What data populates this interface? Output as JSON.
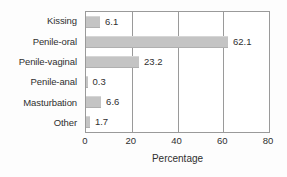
{
  "chart_data": {
    "type": "bar",
    "orientation": "horizontal",
    "title": "",
    "subtitle": "",
    "categories": [
      "Kissing",
      "Penile-oral",
      "Penile-vaginal",
      "Penile-anal",
      "Masturbation",
      "Other"
    ],
    "values": [
      6.1,
      62.1,
      23.2,
      0.3,
      6.6,
      1.7
    ],
    "data_labels": [
      "6.1",
      "62.1",
      "23.2",
      "0.3",
      "6.6",
      "1.7"
    ],
    "xlabel": "Percentage",
    "ylabel": "",
    "xlim": [
      0,
      80
    ],
    "xticks": [
      0,
      20,
      40,
      60,
      80
    ],
    "xtick_labels": [
      "0",
      "20",
      "40",
      "60",
      "80"
    ],
    "grid": "vertical",
    "legend": "none",
    "bar_color": "#c4c4c4",
    "frame_color": "#9a9a9a",
    "text_color": "#2f2f2f",
    "background_color": "#ffffff"
  }
}
